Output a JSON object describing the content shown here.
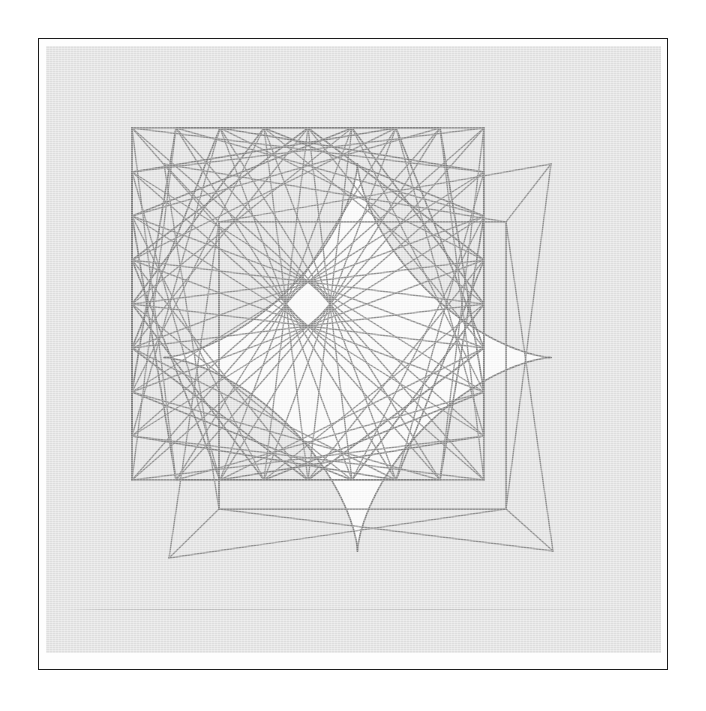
{
  "page": {
    "background_color": "#ffffff",
    "plate_frame_color": "#1d1d1d",
    "plate_field_color": "#e3e3e3",
    "inner_wash_color": "#fbfbfb",
    "line_color": "#8a8a8a",
    "caption": ""
  },
  "figure": {
    "name": "astroid-envelope-string-figure",
    "cusps": [
      {
        "label": "top-left-cusp",
        "x": 163,
        "y": 163
      },
      {
        "label": "top-right-cusp",
        "x": 550,
        "y": 163
      },
      {
        "label": "bottom-right-cusp",
        "x": 552,
        "y": 550
      },
      {
        "label": "bottom-left-cusp",
        "x": 168,
        "y": 557
      }
    ],
    "inner_square": {
      "x0": 218,
      "y0": 221,
      "x1": 505,
      "y1": 508
    }
  },
  "chart_data": {
    "type": "scatter",
    "title": "",
    "subtitle": "",
    "xlabel": "",
    "ylabel": "",
    "grid": false,
    "legend": null,
    "xlim": [
      0,
      615
    ],
    "ylim": [
      0,
      607
    ],
    "annotations": [],
    "geometry": {
      "kind": "modular-chord-envelope",
      "perimeter_shape": "square",
      "points_per_side": 8,
      "total_points": 32,
      "square": {
        "cx": 307,
        "cy": 303,
        "half_side": 176
      },
      "multipliers": [
        7,
        9,
        15,
        17
      ],
      "cusp_count": 4,
      "line_width": 1.45,
      "line_color": "#8a8a8a"
    },
    "series": [
      {
        "name": "chords-step-7",
        "values": []
      },
      {
        "name": "chords-step-9",
        "values": []
      },
      {
        "name": "chords-step-15",
        "values": []
      },
      {
        "name": "chords-step-17",
        "values": []
      }
    ]
  }
}
